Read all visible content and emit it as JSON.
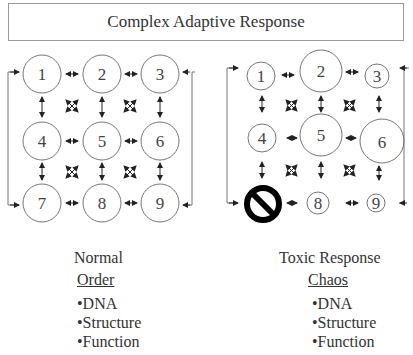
{
  "title": "Complex Adaptive Response",
  "normal": {
    "heading": "Normal",
    "subheading": "Order",
    "bullets": [
      "•DNA",
      "•Structure",
      "•Function"
    ],
    "nodes": [
      "1",
      "2",
      "3",
      "4",
      "5",
      "6",
      "7",
      "8",
      "9"
    ]
  },
  "toxic": {
    "heading": "Toxic Response",
    "subheading": "Chaos",
    "bullets": [
      "•DNA",
      "•Structure",
      "•Function"
    ],
    "nodes": [
      "1",
      "2",
      "3",
      "4",
      "5",
      "6",
      "7",
      "8",
      "9"
    ],
    "blocked_node": "7"
  },
  "colors": {
    "line": "#555555",
    "text": "#333333",
    "block": "#000000"
  }
}
